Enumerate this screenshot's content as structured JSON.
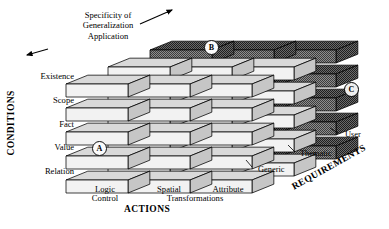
{
  "diagram": {
    "caption": {
      "text": "Specificity of\nGeneralization\nApplication",
      "line1": "Specificity of",
      "line2": "Generalization",
      "line3": "Application"
    },
    "axes": {
      "vertical": {
        "name": "conditions-axis",
        "title": "CONDITIONS",
        "ticks": [
          "Existence",
          "Scope",
          "Fact",
          "Value",
          "Relation"
        ]
      },
      "horizontal": {
        "name": "actions-axis",
        "title": "ACTIONS",
        "ticks": [
          "Logic\nControl",
          "Spatial",
          "Attribute"
        ],
        "tick_labels": [
          {
            "line1": "Logic",
            "line2": "Control"
          },
          {
            "line1": "Spatial",
            "line2": ""
          },
          {
            "line1": "Attribute",
            "line2": ""
          }
        ],
        "shared_suffix": "Transformations"
      },
      "depth": {
        "name": "requirements-axis",
        "title": "REQUIREMENTS",
        "ticks": [
          "Generic",
          "Thematic",
          "User"
        ]
      }
    },
    "markers": [
      {
        "id": "A",
        "label": "A",
        "cell": "Value / Logic Control / Generic"
      },
      {
        "id": "B",
        "label": "B",
        "cell": "top / Spatial Transformations / Thematic"
      },
      {
        "id": "C",
        "label": "C",
        "cell": "Fact / right face / User"
      }
    ],
    "grid": {
      "rows": 5,
      "columns": 3,
      "depth_layers": 3
    },
    "colors": {
      "block_front": "#f2f2f2",
      "block_top": "#d9d9d9",
      "block_side": "#c6c6c6",
      "block_dark": "#6f6f6f",
      "block_dark_top": "#4a4a4a",
      "outline": "#000000",
      "background": "#ffffff",
      "text": "#000000"
    }
  }
}
